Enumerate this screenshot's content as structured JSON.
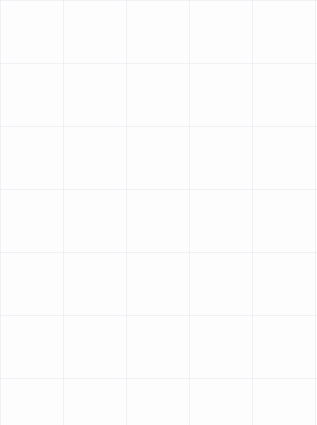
{
  "drawing": {
    "title": "Hand-drawn brick-bond tiling sketch",
    "medium": "ink on graph paper",
    "background_color": "#fdfdfd",
    "ink_color": "#1a1a1a",
    "grid_paper_color": "#7a8caa",
    "canvas": {
      "width": 317,
      "height": 425
    },
    "outer_frame": {
      "label": "outer border rectangle",
      "x": 12,
      "y": 14,
      "width": 293,
      "height": 394,
      "stroke_width": 2.2
    },
    "inner_frame": {
      "label": "inner grid border rectangle",
      "x": 44,
      "y": 39,
      "width": 242,
      "height": 339,
      "stroke_width": 2.2
    },
    "margin_rule": {
      "label": "horizontal margin rule at left",
      "x1": 12,
      "y1": 222,
      "x2": 62,
      "y2": 222,
      "stroke_width": 2.0
    },
    "column_dividers_x": [
      44,
      92,
      141,
      189,
      237,
      286
    ],
    "columns": [
      {
        "index": 1,
        "name": "column-1",
        "x": 44,
        "width": 48,
        "offset_phase": "aligned",
        "cells": [
          {
            "type": "x",
            "y": 39,
            "height": 59
          },
          {
            "type": "blank",
            "y": 98,
            "height": 28
          },
          {
            "type": "x",
            "y": 126,
            "height": 59
          },
          {
            "type": "blank",
            "y": 185,
            "height": 28
          },
          {
            "type": "x",
            "y": 213,
            "height": 59
          },
          {
            "type": "blank",
            "y": 272,
            "height": 28
          },
          {
            "type": "x",
            "y": 300,
            "height": 59
          },
          {
            "type": "blank",
            "y": 359,
            "height": 19
          }
        ]
      },
      {
        "index": 2,
        "name": "column-2",
        "x": 92,
        "width": 49,
        "offset_phase": "offset",
        "cells": [
          {
            "type": "blank",
            "y": 39,
            "height": 47
          },
          {
            "type": "x",
            "y": 86,
            "height": 59
          },
          {
            "type": "blank",
            "y": 145,
            "height": 28
          },
          {
            "type": "x",
            "y": 173,
            "height": 59
          },
          {
            "type": "blank",
            "y": 232,
            "height": 28
          },
          {
            "type": "x",
            "y": 260,
            "height": 59
          },
          {
            "type": "blank",
            "y": 319,
            "height": 59
          }
        ]
      },
      {
        "index": 3,
        "name": "column-3",
        "x": 141,
        "width": 48,
        "offset_phase": "aligned",
        "cells": [
          {
            "type": "blank",
            "y": 39,
            "height": 71
          },
          {
            "type": "blank",
            "y": 110,
            "height": 22
          },
          {
            "type": "x",
            "y": 132,
            "height": 59
          },
          {
            "type": "blank",
            "y": 191,
            "height": 28
          },
          {
            "type": "x",
            "y": 219,
            "height": 59
          },
          {
            "type": "blank",
            "y": 278,
            "height": 28
          },
          {
            "type": "blank",
            "y": 306,
            "height": 72
          }
        ]
      },
      {
        "index": 4,
        "name": "column-4",
        "x": 189,
        "width": 48,
        "offset_phase": "offset",
        "cells": [
          {
            "type": "blank",
            "y": 39,
            "height": 40
          },
          {
            "type": "x",
            "y": 79,
            "height": 59
          },
          {
            "type": "blank",
            "y": 138,
            "height": 28
          },
          {
            "type": "x",
            "y": 166,
            "height": 59
          },
          {
            "type": "blank",
            "y": 225,
            "height": 28
          },
          {
            "type": "x",
            "y": 253,
            "height": 59
          },
          {
            "type": "blank",
            "y": 312,
            "height": 28
          },
          {
            "type": "blank",
            "y": 340,
            "height": 38
          }
        ]
      },
      {
        "index": 5,
        "name": "column-5",
        "x": 237,
        "width": 49,
        "offset_phase": "aligned",
        "cells": [
          {
            "type": "x",
            "y": 39,
            "height": 59
          },
          {
            "type": "blank",
            "y": 98,
            "height": 28
          },
          {
            "type": "x",
            "y": 126,
            "height": 59
          },
          {
            "type": "blank",
            "y": 185,
            "height": 28
          },
          {
            "type": "x",
            "y": 213,
            "height": 59
          },
          {
            "type": "blank",
            "y": 272,
            "height": 28
          },
          {
            "type": "x",
            "y": 300,
            "height": 59
          },
          {
            "type": "blank",
            "y": 359,
            "height": 19
          }
        ]
      }
    ],
    "x_mark": {
      "label": "hand-drawn cross mark",
      "stroke_width": 2.0,
      "inset_x": 10,
      "inset_y": 9,
      "style": "slightly curved tapered ink strokes"
    }
  }
}
